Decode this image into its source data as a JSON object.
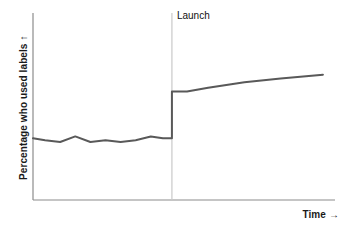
{
  "chart_data": {
    "type": "line",
    "title": "",
    "subtitle": "",
    "xlabel": "Time →",
    "ylabel": "Percentage who used labels ↑",
    "xlim": [
      0,
      100
    ],
    "ylim": [
      0,
      100
    ],
    "grid": false,
    "legend": null,
    "axis_style": "open-left-bottom",
    "line_color": "#595959",
    "annotations": [
      {
        "name": "launch-marker",
        "label": "Launch",
        "type": "vertical-line",
        "x": 46,
        "color": "#c9c9c9",
        "label_position": "top-right"
      }
    ],
    "series": [
      {
        "name": "Percentage who used labels",
        "color": "#595959",
        "x": [
          0,
          4,
          9,
          14,
          19,
          24,
          29,
          34,
          39,
          43,
          46,
          46,
          51,
          58,
          70,
          82,
          96
        ],
        "y": [
          33,
          32,
          31,
          34,
          31,
          32,
          31,
          32,
          34,
          33,
          33,
          58,
          58,
          60,
          63,
          65,
          67
        ],
        "description": "Flat noisy baseline before launch, sharp step up at launch, then gradual rise"
      }
    ],
    "xtick_labels": [],
    "ytick_labels": []
  },
  "labels": {
    "y_axis_title": "Percentage who used labels  ↑",
    "x_axis_title": "Time  →",
    "launch": "Launch"
  },
  "colors": {
    "background": "#ffffff",
    "axis": "#808080",
    "data_line": "#595959",
    "marker_line": "#c9c9c9",
    "text": "#1a1a1a"
  }
}
